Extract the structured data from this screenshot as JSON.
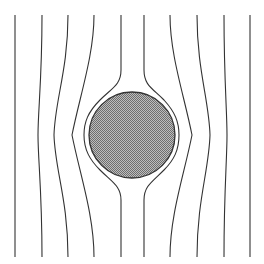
{
  "diagram": {
    "type": "streamlines-around-cylinder",
    "width": 264,
    "height": 264,
    "background": "#ffffff",
    "line_color": "#333333",
    "obstacle": {
      "shape": "circle",
      "cx": 132,
      "cy": 135,
      "r": 43,
      "fill": "#9a9a9a",
      "pattern": "stipple",
      "stroke": "#333333"
    },
    "streamlines": [
      {
        "id": "s1",
        "d": "M15 15 L15 257"
      },
      {
        "id": "s2",
        "d": "M42 15 C42 80 38 110 38 135 C38 160 42 190 42 257"
      },
      {
        "id": "s3",
        "d": "M68 15 C68 70 55 100 54 135 C55 170 68 200 68 257"
      },
      {
        "id": "s4",
        "d": "M94 15 C94 55 80 95 72 135 C80 175 94 215 94 257"
      },
      {
        "id": "s5",
        "d": "M121 15 L121 70 C121 85 112 88 100 100 C88 112 84 122 84 135 C84 150 90 160 100 170 C112 182 121 186 121 200 L121 257"
      },
      {
        "id": "s6",
        "d": "M144 15 L144 70 C144 85 152 88 164 100 C175 112 179 122 179 135 C179 150 174 160 164 170 C152 182 144 186 144 200 L144 257"
      },
      {
        "id": "s7",
        "d": "M170 15 C170 55 184 95 192 135 C184 175 170 215 170 257"
      },
      {
        "id": "s8",
        "d": "M197 15 C197 70 209 100 210 135 C209 170 197 200 197 257"
      },
      {
        "id": "s9",
        "d": "M224 15 C224 80 227 110 227 135 C227 160 224 190 224 257"
      },
      {
        "id": "s10",
        "d": "M250 15 L250 257"
      }
    ]
  }
}
